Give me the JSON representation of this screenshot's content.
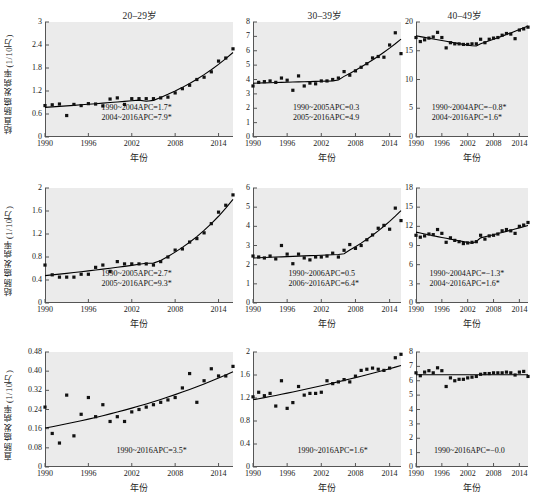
{
  "figure": {
    "background_color": "#ffffff",
    "panel_background_color": "#ebebeb",
    "marker_color": "#111111",
    "line_color": "#000000",
    "column_titles": [
      "20–29岁",
      "30–39岁",
      "40–49岁"
    ],
    "row_ylabels": [
      "结直肠癌发病率(1/10万)",
      "结肠癌发病率(1/10万)",
      "直肠癌发病率(1/10万)"
    ],
    "xlabel": "年份"
  },
  "chart_data": [
    {
      "id": "r1c1",
      "type": "scatter",
      "title": "20–29岁",
      "xlabel": "年份",
      "ylabel": "结直肠癌发病率(1/10万)",
      "xlim": [
        1990,
        2016
      ],
      "ylim": [
        0,
        3
      ],
      "xticks": [
        1990,
        1996,
        2002,
        2008,
        2014
      ],
      "yticks": [
        0,
        0.6,
        1.2,
        1.8,
        2.4,
        3
      ],
      "ytick_labels": [
        "0",
        "0.6",
        "1.2",
        "1.8",
        "2.4",
        "3"
      ],
      "grid": false,
      "legend": "none",
      "x": [
        1990,
        1991,
        1992,
        1993,
        1994,
        1995,
        1996,
        1997,
        1998,
        1999,
        2000,
        2001,
        2002,
        2003,
        2004,
        2005,
        2006,
        2007,
        2008,
        2009,
        2010,
        2011,
        2012,
        2013,
        2014,
        2015,
        2016
      ],
      "values": [
        0.82,
        0.84,
        0.86,
        0.56,
        0.85,
        0.82,
        0.87,
        0.86,
        0.81,
        0.99,
        1.02,
        0.85,
        1.0,
        1.0,
        1.0,
        1.0,
        1.02,
        1.04,
        1.15,
        1.26,
        1.35,
        1.5,
        1.56,
        1.7,
        1.98,
        2.06,
        2.3
      ],
      "trend_segments": [
        {
          "period": "1990–2004",
          "apc": 1.7,
          "significant": true
        },
        {
          "period": "2004–2016",
          "apc": 7.9,
          "significant": true
        }
      ],
      "annotations": [
        "1990~2004APC=1.7*",
        "2004~2016APC=7.9*"
      ]
    },
    {
      "id": "r1c2",
      "type": "scatter",
      "title": "30–39岁",
      "xlabel": "年份",
      "ylabel": "结直肠癌发病率(1/10万)",
      "xlim": [
        1990,
        2016
      ],
      "ylim": [
        0,
        8
      ],
      "xticks": [
        1990,
        1996,
        2002,
        2008,
        2014
      ],
      "yticks": [
        0,
        1,
        2,
        3,
        4,
        5,
        6,
        7,
        8
      ],
      "ytick_labels": [
        "0",
        "1",
        "2",
        "3",
        "4",
        "5",
        "6",
        "7",
        "8"
      ],
      "grid": false,
      "legend": "none",
      "x": [
        1990,
        1991,
        1992,
        1993,
        1994,
        1995,
        1996,
        1997,
        1998,
        1999,
        2000,
        2001,
        2002,
        2003,
        2004,
        2005,
        2006,
        2007,
        2008,
        2009,
        2010,
        2011,
        2012,
        2013,
        2014,
        2015,
        2016
      ],
      "values": [
        3.55,
        3.8,
        3.85,
        3.9,
        3.8,
        4.1,
        3.95,
        3.25,
        4.25,
        3.55,
        3.75,
        3.7,
        3.9,
        3.9,
        4.0,
        4.1,
        4.55,
        4.3,
        4.6,
        4.85,
        5.1,
        5.5,
        5.6,
        5.55,
        6.4,
        7.25,
        5.8
      ],
      "trend_segments": [
        {
          "period": "1990–2005",
          "apc": 0.3,
          "significant": false
        },
        {
          "period": "2005–2016",
          "apc": 4.9,
          "significant": false
        }
      ],
      "annotations": [
        "1990~2005APC=0.3",
        "2005~2016APC=4.9"
      ]
    },
    {
      "id": "r1c3",
      "type": "scatter",
      "title": "40–49岁",
      "xlabel": "年份",
      "ylabel": "结直肠癌发病率(1/10万)",
      "xlim": [
        1990,
        2016
      ],
      "ylim": [
        0,
        20
      ],
      "xticks": [
        1990,
        1996,
        2002,
        2008,
        2014
      ],
      "yticks": [
        0,
        5,
        10,
        15,
        20
      ],
      "ytick_labels": [
        "0",
        "5",
        "10",
        "15",
        "20"
      ],
      "grid": false,
      "legend": "none",
      "x": [
        1990,
        1991,
        1992,
        1993,
        1994,
        1995,
        1996,
        1997,
        1998,
        1999,
        2000,
        2001,
        2002,
        2003,
        2004,
        2005,
        2006,
        2007,
        2008,
        2009,
        2010,
        2011,
        2012,
        2013,
        2014,
        2015,
        2016
      ],
      "values": [
        17.3,
        16.6,
        16.9,
        17.2,
        17.4,
        18.2,
        17.3,
        15.5,
        16.4,
        16.2,
        16.2,
        16.1,
        16.1,
        16.2,
        16.2,
        17.0,
        16.4,
        17.0,
        17.2,
        17.3,
        17.7,
        18.0,
        17.9,
        17.1,
        18.6,
        18.8,
        19.1
      ],
      "trend_segments": [
        {
          "period": "1990–2004",
          "apc": -0.8,
          "significant": true
        },
        {
          "period": "2004–2016",
          "apc": 1.6,
          "significant": true
        }
      ],
      "annotations": [
        "1990~2004APC=−0.8*",
        "2004~2016APC=1.6*"
      ]
    },
    {
      "id": "r2c1",
      "type": "scatter",
      "title": "20–29岁",
      "xlabel": "年份",
      "ylabel": "结肠癌发病率(1/10万)",
      "xlim": [
        1990,
        2016
      ],
      "ylim": [
        0,
        2
      ],
      "xticks": [
        1990,
        1996,
        2002,
        2008,
        2014
      ],
      "yticks": [
        0,
        0.4,
        0.8,
        1.2,
        1.6,
        2
      ],
      "ytick_labels": [
        "0",
        "0.4",
        "0.8",
        "1.2",
        "1.6",
        "2"
      ],
      "grid": false,
      "legend": "none",
      "x": [
        1990,
        1991,
        1992,
        1993,
        1994,
        1995,
        1996,
        1997,
        1998,
        1999,
        2000,
        2001,
        2002,
        2003,
        2004,
        2005,
        2006,
        2007,
        2008,
        2009,
        2010,
        2011,
        2012,
        2013,
        2014,
        2015,
        2016
      ],
      "values": [
        0.66,
        0.49,
        0.45,
        0.45,
        0.45,
        0.5,
        0.5,
        0.62,
        0.66,
        0.55,
        0.72,
        0.68,
        0.68,
        0.68,
        0.68,
        0.66,
        0.72,
        0.8,
        0.92,
        0.94,
        1.06,
        1.12,
        1.22,
        1.38,
        1.58,
        1.7,
        1.88
      ],
      "trend_segments": [
        {
          "period": "1990–2005",
          "apc": 2.7,
          "significant": true
        },
        {
          "period": "2005–2016",
          "apc": 9.3,
          "significant": true
        }
      ],
      "annotations": [
        "1990~2005APC=2.7*",
        "2005~2016APC=9.3*"
      ]
    },
    {
      "id": "r2c2",
      "type": "scatter",
      "title": "30–39岁",
      "xlabel": "年份",
      "ylabel": "结肠癌发病率(1/10万)",
      "xlim": [
        1990,
        2016
      ],
      "ylim": [
        0,
        6
      ],
      "xticks": [
        1990,
        1996,
        2002,
        2008,
        2014
      ],
      "yticks": [
        0,
        1,
        2,
        3,
        4,
        5,
        6
      ],
      "ytick_labels": [
        "0",
        "1",
        "2",
        "3",
        "4",
        "5",
        "6"
      ],
      "grid": false,
      "legend": "none",
      "x": [
        1990,
        1991,
        1992,
        1993,
        1994,
        1995,
        1996,
        1997,
        1998,
        1999,
        2000,
        2001,
        2002,
        2003,
        2004,
        2005,
        2006,
        2007,
        2008,
        2009,
        2010,
        2011,
        2012,
        2013,
        2014,
        2015,
        2016
      ],
      "values": [
        2.45,
        2.4,
        2.35,
        2.45,
        2.3,
        3.0,
        2.55,
        2.05,
        2.55,
        2.35,
        2.25,
        2.4,
        2.4,
        2.45,
        2.6,
        2.4,
        2.75,
        3.05,
        2.85,
        3.0,
        3.3,
        3.55,
        3.9,
        4.05,
        3.85,
        4.95,
        4.3
      ],
      "trend_segments": [
        {
          "period": "1990–2006",
          "apc": 0.5,
          "significant": false
        },
        {
          "period": "2006–2016",
          "apc": 6.4,
          "significant": true
        }
      ],
      "annotations": [
        "1990~2006APC=0.5",
        "2006~2016APC=6.4*"
      ]
    },
    {
      "id": "r2c3",
      "type": "scatter",
      "title": "40–49岁",
      "xlabel": "年份",
      "ylabel": "结肠癌发病率(1/10万)",
      "xlim": [
        1990,
        2016
      ],
      "ylim": [
        0,
        18
      ],
      "xticks": [
        1990,
        1996,
        2002,
        2008,
        2014
      ],
      "yticks": [
        0,
        3,
        6,
        9,
        12,
        15,
        18
      ],
      "ytick_labels": [
        "0",
        "3",
        "6",
        "9",
        "12",
        "15",
        "18"
      ],
      "grid": false,
      "legend": "none",
      "x": [
        1990,
        1991,
        1992,
        1993,
        1994,
        1995,
        1996,
        1997,
        1998,
        1999,
        2000,
        2001,
        2002,
        2003,
        2004,
        2005,
        2006,
        2007,
        2008,
        2009,
        2010,
        2011,
        2012,
        2013,
        2014,
        2015,
        2016
      ],
      "values": [
        10.6,
        10.3,
        10.5,
        10.8,
        10.7,
        11.5,
        10.9,
        9.5,
        10.2,
        9.8,
        9.6,
        9.3,
        9.4,
        9.5,
        9.6,
        10.6,
        10.0,
        10.5,
        10.6,
        10.8,
        11.3,
        11.5,
        11.3,
        10.9,
        12.0,
        12.2,
        12.6
      ],
      "trend_segments": [
        {
          "period": "1990–2004",
          "apc": -1.3,
          "significant": true
        },
        {
          "period": "2004–2016",
          "apc": 1.6,
          "significant": true
        }
      ],
      "annotations": [
        "1990~2004APC=−1.3*",
        "2004~2016APC=1.6*"
      ]
    },
    {
      "id": "r3c1",
      "type": "scatter",
      "title": "20–29岁",
      "xlabel": "年份",
      "ylabel": "直肠癌发病率(1/10万)",
      "xlim": [
        1990,
        2016
      ],
      "ylim": [
        0,
        0.48
      ],
      "xticks": [
        1990,
        1996,
        2002,
        2008,
        2014
      ],
      "yticks": [
        0,
        0.08,
        0.16,
        0.24,
        0.32,
        0.4,
        0.48
      ],
      "ytick_labels": [
        "0",
        "0.08",
        "0.16",
        "0.24",
        "0.32",
        "0.40",
        "0.48"
      ],
      "grid": false,
      "legend": "none",
      "x": [
        1990,
        1991,
        1992,
        1993,
        1994,
        1995,
        1996,
        1997,
        1998,
        1999,
        2000,
        2001,
        2002,
        2003,
        2004,
        2005,
        2006,
        2007,
        2008,
        2009,
        2010,
        2011,
        2012,
        2013,
        2014,
        2015,
        2016
      ],
      "values": [
        0.25,
        0.14,
        0.1,
        0.3,
        0.13,
        0.22,
        0.29,
        0.21,
        0.26,
        0.19,
        0.21,
        0.19,
        0.23,
        0.24,
        0.25,
        0.26,
        0.27,
        0.28,
        0.29,
        0.33,
        0.39,
        0.27,
        0.36,
        0.41,
        0.38,
        0.38,
        0.42
      ],
      "trend_segments": [
        {
          "period": "1990–2016",
          "apc": 3.5,
          "significant": true
        }
      ],
      "annotations": [
        "1990~2016APC=3.5*"
      ]
    },
    {
      "id": "r3c2",
      "type": "scatter",
      "title": "30–39岁",
      "xlabel": "年份",
      "ylabel": "直肠癌发病率(1/10万)",
      "xlim": [
        1990,
        2016
      ],
      "ylim": [
        0,
        2
      ],
      "xticks": [
        1990,
        1996,
        2002,
        2008,
        2014
      ],
      "yticks": [
        0,
        0.4,
        0.8,
        1.2,
        1.6,
        2
      ],
      "ytick_labels": [
        "0",
        "0.4",
        "0.8",
        "1.2",
        "1.6",
        "2"
      ],
      "grid": false,
      "legend": "none",
      "x": [
        1990,
        1991,
        1992,
        1993,
        1994,
        1995,
        1996,
        1997,
        1998,
        1999,
        2000,
        2001,
        2002,
        2003,
        2004,
        2005,
        2006,
        2007,
        2008,
        2009,
        2010,
        2011,
        2012,
        2013,
        2014,
        2015,
        2016
      ],
      "values": [
        1.22,
        1.3,
        1.24,
        1.28,
        1.06,
        1.5,
        1.02,
        1.12,
        1.4,
        1.25,
        1.28,
        1.28,
        1.3,
        1.5,
        1.45,
        1.48,
        1.52,
        1.48,
        1.58,
        1.68,
        1.7,
        1.72,
        1.7,
        1.68,
        1.72,
        1.9,
        1.96
      ],
      "trend_segments": [
        {
          "period": "1990–2016",
          "apc": 1.6,
          "significant": true
        }
      ],
      "annotations": [
        "1990~2016APC=1.6*"
      ]
    },
    {
      "id": "r3c3",
      "type": "scatter",
      "title": "40–49岁",
      "xlabel": "年份",
      "ylabel": "直肠癌发病率(1/10万)",
      "xlim": [
        1990,
        2016
      ],
      "ylim": [
        0,
        8
      ],
      "xticks": [
        1990,
        1996,
        2002,
        2008,
        2014
      ],
      "yticks": [
        0,
        1,
        2,
        3,
        4,
        5,
        6,
        7,
        8
      ],
      "ytick_labels": [
        "0",
        "1",
        "2",
        "3",
        "4",
        "5",
        "6",
        "7",
        "8"
      ],
      "grid": false,
      "legend": "none",
      "x": [
        1990,
        1991,
        1992,
        1993,
        1994,
        1995,
        1996,
        1997,
        1998,
        1999,
        2000,
        2001,
        2002,
        2003,
        2004,
        2005,
        2006,
        2007,
        2008,
        2009,
        2010,
        2011,
        2012,
        2013,
        2014,
        2015,
        2016
      ],
      "values": [
        6.55,
        6.35,
        6.6,
        6.7,
        6.55,
        6.9,
        6.7,
        5.6,
        6.2,
        6.0,
        6.1,
        6.1,
        6.2,
        6.25,
        6.3,
        6.45,
        6.5,
        6.5,
        6.55,
        6.55,
        6.55,
        6.6,
        6.55,
        6.4,
        6.6,
        6.65,
        6.3
      ],
      "trend_segments": [
        {
          "period": "1990–2016",
          "apc": -0.0,
          "significant": false
        }
      ],
      "annotations": [
        "1990~2016APC=−0.0"
      ]
    }
  ]
}
